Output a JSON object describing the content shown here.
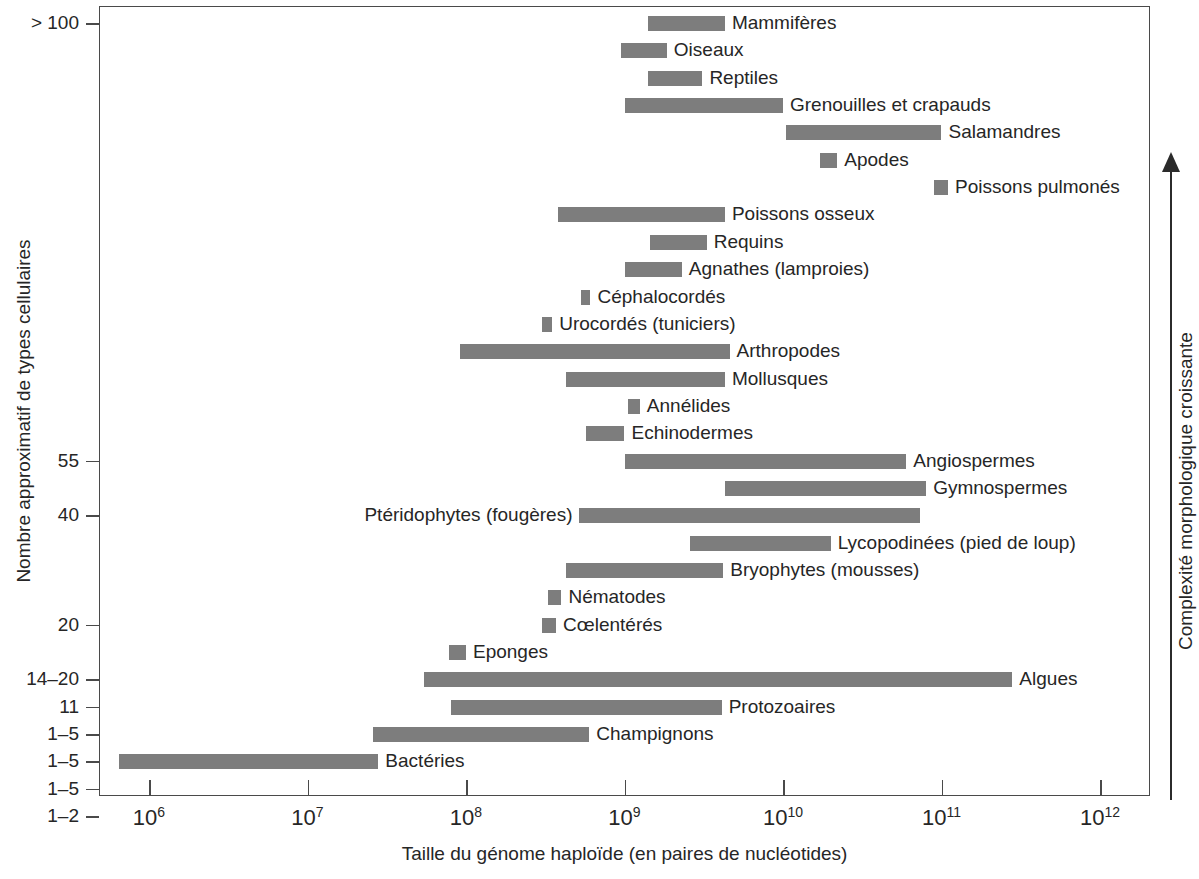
{
  "chart_data": {
    "type": "bar",
    "orientation": "horizontal-range",
    "title": "",
    "xlabel": "Taille du génome haploïde (en paires de nucléotides)",
    "ylabel": "Nombre approximatif de types cellulaires",
    "right_axis_label": "Complexité morphologique croissante",
    "xscale": "log",
    "xlim": [
      1000000,
      1000000000000
    ],
    "xticks": [
      {
        "value": 1000000,
        "mantissa": "10",
        "exponent": "6"
      },
      {
        "value": 10000000,
        "mantissa": "10",
        "exponent": "7"
      },
      {
        "value": 100000000,
        "mantissa": "10",
        "exponent": "8"
      },
      {
        "value": 1000000000,
        "mantissa": "10",
        "exponent": "9"
      },
      {
        "value": 10000000000,
        "mantissa": "10",
        "exponent": "10"
      },
      {
        "value": 100000000000,
        "mantissa": "10",
        "exponent": "11"
      },
      {
        "value": 1000000000000,
        "mantissa": "10",
        "exponent": "12"
      }
    ],
    "yticks": [
      {
        "label": "> 100",
        "row": 0
      },
      {
        "label": "55",
        "row": 16
      },
      {
        "label": "40",
        "row": 18
      },
      {
        "label": "20",
        "row": 22
      },
      {
        "label": "14–20",
        "row": 24
      },
      {
        "label": "11",
        "row": 25
      },
      {
        "label": "1–5",
        "row": 26
      },
      {
        "label": "1–5",
        "row": 27
      },
      {
        "label": "1–5",
        "row": 28
      },
      {
        "label": "1–2",
        "row": 29
      }
    ],
    "bar_color": "#7d7d7d",
    "grid": false,
    "legend": false,
    "categories": [
      "Mammifères",
      "Oiseaux",
      "Reptiles",
      "Grenouilles et crapauds",
      "Salamandres",
      "Apodes",
      "Poissons pulmonés",
      "Poissons osseux",
      "Requins",
      "Agnathes (lamproies)",
      "Céphalocordés",
      "Urocordés (tuniciers)",
      "Arthropodes",
      "Mollusques",
      "Annélides",
      "Echinodermes",
      "Angiospermes",
      "Gymnospermes",
      "Ptéridophytes (fougères)",
      "Lycopodinées (pied de loup)",
      "Bryophytes (mousses)",
      "Nématodes",
      "Cœlentérés",
      "Eponges",
      "Algues",
      "Protozoaires",
      "Champignons",
      "Bactéries"
    ],
    "bars": [
      {
        "label": "Mammifères",
        "row": 0,
        "x_min": 1400000000.0,
        "x_max": 4300000000.0,
        "label_side": "right"
      },
      {
        "label": "Oiseaux",
        "row": 1,
        "x_min": 950000000.0,
        "x_max": 1850000000.0,
        "label_side": "right"
      },
      {
        "label": "Reptiles",
        "row": 2,
        "x_min": 1400000000.0,
        "x_max": 3100000000.0,
        "label_side": "right"
      },
      {
        "label": "Grenouilles et crapauds",
        "row": 3,
        "x_min": 1000000000.0,
        "x_max": 10000000000.0,
        "label_side": "right"
      },
      {
        "label": "Salamandres",
        "row": 4,
        "x_min": 10500000000.0,
        "x_max": 100000000000.0,
        "label_side": "right"
      },
      {
        "label": "Apodes",
        "row": 5,
        "x_min": 17000000000.0,
        "x_max": 22000000000.0,
        "label_side": "right"
      },
      {
        "label": "Poissons pulmonés",
        "row": 6,
        "x_min": 90000000000.0,
        "x_max": 110000000000.0,
        "label_side": "right"
      },
      {
        "label": "Poissons osseux",
        "row": 7,
        "x_min": 380000000.0,
        "x_max": 4300000000.0,
        "label_side": "right"
      },
      {
        "label": "Requins",
        "row": 8,
        "x_min": 1450000000.0,
        "x_max": 3300000000.0,
        "label_side": "right"
      },
      {
        "label": "Agnathes (lamproies)",
        "row": 9,
        "x_min": 1000000000.0,
        "x_max": 2300000000.0,
        "label_side": "right"
      },
      {
        "label": "Céphalocordés",
        "row": 10,
        "x_min": 530000000.0,
        "x_max": 610000000.0,
        "label_side": "right"
      },
      {
        "label": "Urocordés (tuniciers)",
        "row": 11,
        "x_min": 300000000.0,
        "x_max": 350000000.0,
        "label_side": "right"
      },
      {
        "label": "Arthropodes",
        "row": 12,
        "x_min": 92000000.0,
        "x_max": 4600000000.0,
        "label_side": "right"
      },
      {
        "label": "Mollusques",
        "row": 13,
        "x_min": 430000000.0,
        "x_max": 4300000000.0,
        "label_side": "right"
      },
      {
        "label": "Annélides",
        "row": 14,
        "x_min": 1050000000.0,
        "x_max": 1250000000.0,
        "label_side": "right"
      },
      {
        "label": "Echinodermes",
        "row": 15,
        "x_min": 570000000.0,
        "x_max": 1000000000.0,
        "label_side": "right"
      },
      {
        "label": "Angiospermes",
        "row": 16,
        "x_min": 1000000000.0,
        "x_max": 60000000000.0,
        "label_side": "right"
      },
      {
        "label": "Gymnospermes",
        "row": 17,
        "x_min": 4300000000.0,
        "x_max": 80000000000.0,
        "label_side": "right"
      },
      {
        "label": "Ptéridophytes (fougères)",
        "row": 18,
        "x_min": 520000000.0,
        "x_max": 73000000000.0,
        "label_side": "left"
      },
      {
        "label": "Lycopodinées (pied de loup)",
        "row": 19,
        "x_min": 2600000000.0,
        "x_max": 20000000000.0,
        "label_side": "right"
      },
      {
        "label": "Bryophytes (mousses)",
        "row": 20,
        "x_min": 430000000.0,
        "x_max": 4200000000.0,
        "label_side": "right"
      },
      {
        "label": "Nématodes",
        "row": 21,
        "x_min": 330000000.0,
        "x_max": 400000000.0,
        "label_side": "right"
      },
      {
        "label": "Cœlentérés",
        "row": 22,
        "x_min": 300000000.0,
        "x_max": 370000000.0,
        "label_side": "right"
      },
      {
        "label": "Eponges",
        "row": 23,
        "x_min": 78000000.0,
        "x_max": 100000000.0,
        "label_side": "right"
      },
      {
        "label": "Algues",
        "row": 24,
        "x_min": 54000000.0,
        "x_max": 280000000000.0,
        "label_side": "right"
      },
      {
        "label": "Protozoaires",
        "row": 25,
        "x_min": 80000000.0,
        "x_max": 4100000000.0,
        "label_side": "right"
      },
      {
        "label": "Champignons",
        "row": 26,
        "x_min": 26000000.0,
        "x_max": 600000000.0,
        "label_side": "right"
      },
      {
        "label": "Bactéries",
        "row": 27,
        "x_min": 650000.0,
        "x_max": 28000000.0,
        "label_side": "right"
      }
    ]
  }
}
